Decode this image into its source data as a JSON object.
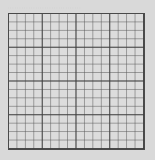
{
  "caption": {
    "text": "· · · · · · · · · · · · · · · · · · · · · · · · · · · · · · · ·"
  },
  "grid": {
    "columns": 16,
    "rows": 16,
    "major_every": 4,
    "background_color": "#dcdcdc",
    "line_color": "#4a4a4a"
  }
}
